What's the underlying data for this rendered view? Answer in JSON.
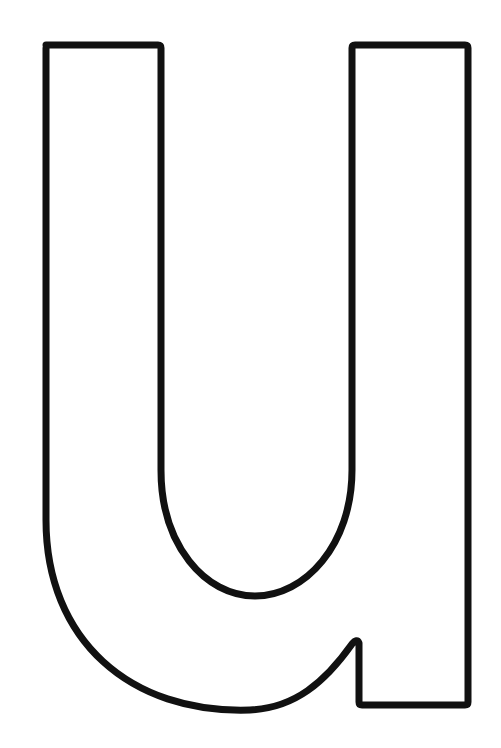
{
  "figure": {
    "letter": "u",
    "style": "outline coloring page",
    "stroke_color": "#111111",
    "fill_color": "#ffffff",
    "background": "#ffffff"
  }
}
